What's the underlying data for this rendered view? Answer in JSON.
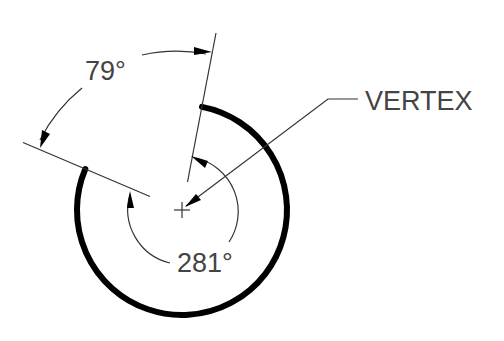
{
  "diagram": {
    "labels": {
      "outer_angle": "79°",
      "inner_angle": "281°",
      "vertex": "VERTEX"
    },
    "geometry": {
      "vertex_center": [
        182,
        210
      ],
      "thick_arc_radius": 105,
      "thick_arc_start_deg": 79,
      "thick_arc_end_deg": 157,
      "thick_arc_sweep_deg": 281,
      "inner_dim_arc_radius": 55,
      "outer_dim_arc_radius": 160
    },
    "colors": {
      "line": "#000000",
      "thin_line": "#333333",
      "text": "#444444",
      "background": "#ffffff"
    }
  }
}
